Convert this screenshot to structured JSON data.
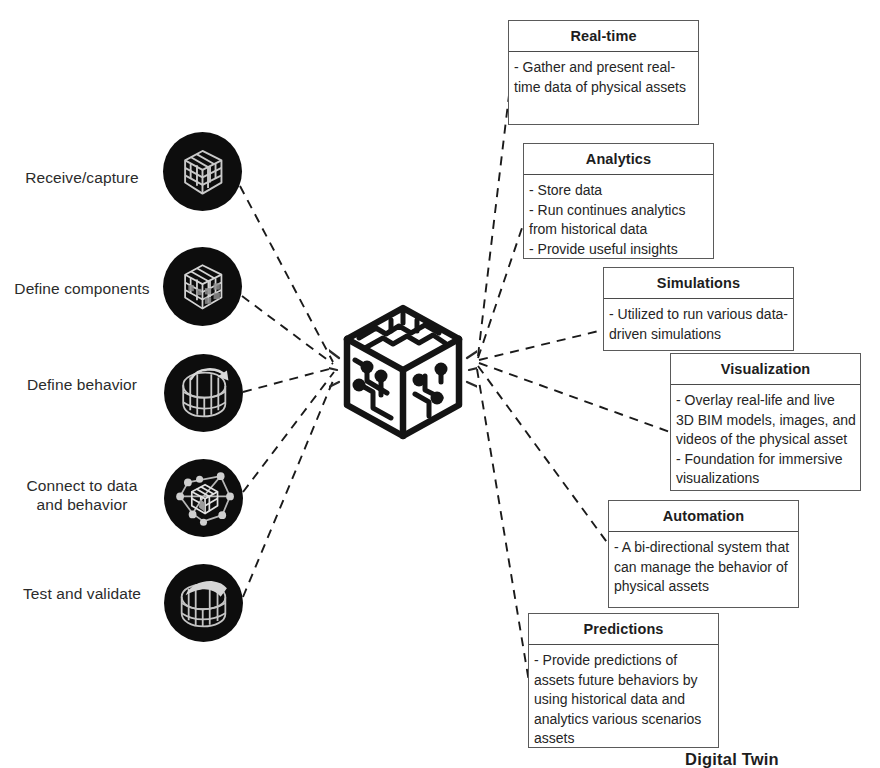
{
  "center": {
    "caption": "Digital Twin",
    "icon": "circuit-cube-icon"
  },
  "process_steps": [
    {
      "label": "Receive/capture",
      "icon": "cube-grid-icon"
    },
    {
      "label": "Define components",
      "icon": "cube-components-icon"
    },
    {
      "label": "Define behavior",
      "icon": "cube-rotate-arrow-icon"
    },
    {
      "label": "Connect to data\nand behavior",
      "icon": "cube-network-nodes-icon"
    },
    {
      "label": "Test and validate",
      "icon": "cube-check-icon"
    }
  ],
  "capabilities": [
    {
      "title": "Real-time",
      "lines": [
        "- Gather and present real-time data of physical assets"
      ]
    },
    {
      "title": "Analytics",
      "lines": [
        "- Store data",
        "- Run continues analytics from historical data",
        "- Provide useful insights"
      ]
    },
    {
      "title": "Simulations",
      "lines": [
        "- Utilized to run various data-driven simulations"
      ]
    },
    {
      "title": "Visualization",
      "lines": [
        "- Overlay real-life and live 3D BIM models, images, and videos of the physical asset",
        "- Foundation for immersive visualizations"
      ]
    },
    {
      "title": "Automation",
      "lines": [
        "- A bi-directional system that can manage the behavior of physical assets"
      ]
    },
    {
      "title": "Predictions",
      "lines": [
        "- Provide predictions of assets future behaviors by using historical data and analytics various scenarios assets"
      ]
    }
  ],
  "colors": {
    "background": "#ffffff",
    "text": "#231f20",
    "card_border": "#5a5a5a",
    "icon_background": "#0d0d0d",
    "connector": "#1a1a1a"
  }
}
